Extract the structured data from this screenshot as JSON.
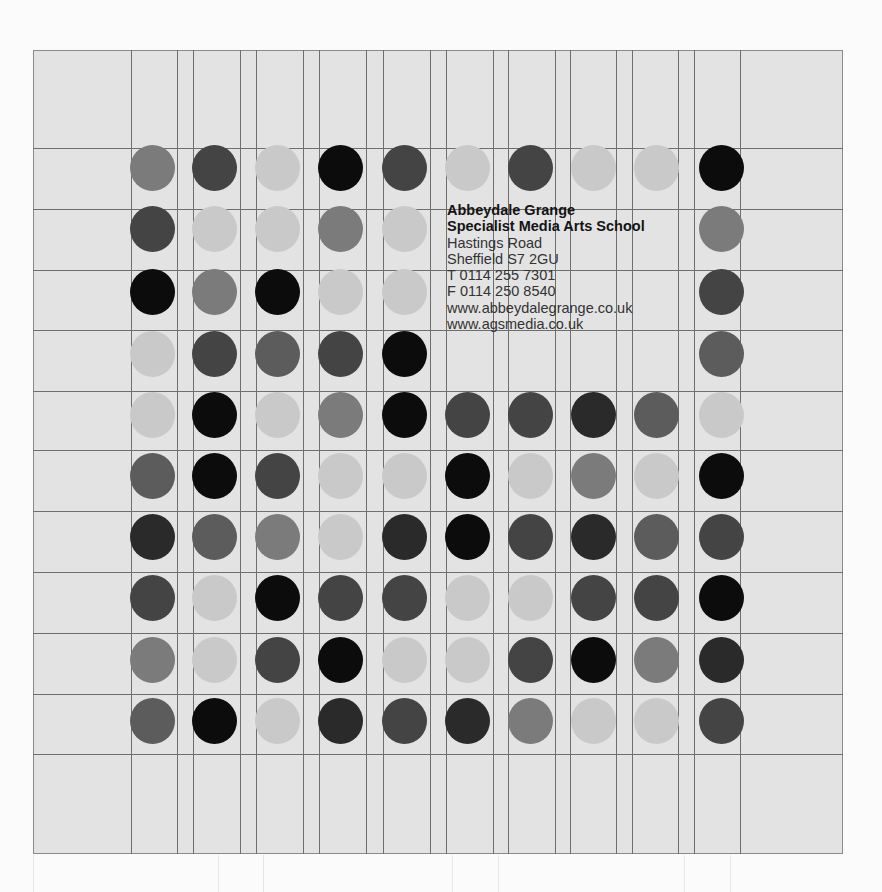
{
  "address": {
    "line1": "Abbeydale Grange",
    "line2": "Specialist Media Arts School",
    "line3": "Hastings Road",
    "line4": "Sheffield S7 2GU",
    "phone": "T 0114 255 7301",
    "fax": "F 0114 250 8540",
    "web1": "www.abbeydalegrange.co.uk",
    "web2": "www.agsmedia.co.uk"
  },
  "palette": {
    "L": "#c9c9c9",
    "M": "#7b7b7b",
    "D": "#5c5c5c",
    "K": "#444444",
    "X": "#2a2a2a",
    "B": "#0c0c0c"
  },
  "grid": {
    "card_background": "#e3e3e3",
    "line_color": "#6e6e6e",
    "vertical_lines_x": [
      131,
      177,
      193,
      240,
      256,
      303,
      319,
      366,
      383,
      430,
      446,
      493,
      508,
      555,
      570,
      616,
      632,
      678,
      694,
      740
    ],
    "horizontal_lines_y": [
      148,
      209,
      270,
      330,
      391,
      450,
      511,
      572,
      633,
      694,
      754
    ],
    "faint_lines_x": [
      218,
      263,
      452,
      498,
      684,
      730
    ]
  },
  "dots": {
    "column_centers_x": [
      152,
      214,
      277,
      340,
      404,
      467,
      530,
      593,
      656,
      721
    ],
    "row_centers_y": [
      168,
      229,
      292,
      354,
      415,
      476,
      537,
      598,
      660,
      721
    ],
    "rows": [
      [
        "M",
        "K",
        "L",
        "B",
        "K",
        "L",
        "K",
        "L",
        "L",
        "B"
      ],
      [
        "K",
        "L",
        "L",
        "M",
        "L",
        "",
        "",
        "",
        "",
        "M"
      ],
      [
        "B",
        "M",
        "B",
        "L",
        "L",
        "",
        "",
        "",
        "",
        "K"
      ],
      [
        "L",
        "K",
        "D",
        "K",
        "B",
        "",
        "",
        "",
        "",
        "D"
      ],
      [
        "L",
        "B",
        "L",
        "M",
        "B",
        "K",
        "K",
        "X",
        "D",
        "L"
      ],
      [
        "D",
        "B",
        "K",
        "L",
        "L",
        "B",
        "L",
        "M",
        "L",
        "B"
      ],
      [
        "X",
        "D",
        "M",
        "L",
        "X",
        "B",
        "K",
        "X",
        "D",
        "K"
      ],
      [
        "K",
        "L",
        "B",
        "K",
        "K",
        "L",
        "L",
        "K",
        "K",
        "B"
      ],
      [
        "M",
        "L",
        "K",
        "B",
        "L",
        "L",
        "K",
        "B",
        "M",
        "X"
      ],
      [
        "D",
        "B",
        "L",
        "X",
        "K",
        "X",
        "M",
        "L",
        "L",
        "K"
      ]
    ]
  }
}
